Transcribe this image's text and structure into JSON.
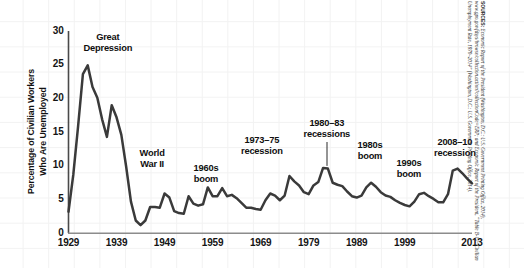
{
  "chart_data": {
    "type": "line",
    "title": "",
    "xlabel": "",
    "ylabel": "Percentage of Civilian Workers Who Are Unemployed",
    "ylabel_line1": "Percentage of Civilian Workers",
    "ylabel_line2": "Who Are Unemployed",
    "xlim": [
      1929,
      2013
    ],
    "ylim": [
      0,
      30
    ],
    "grid": true,
    "grid_style": "faint background graph paper",
    "legend": "none",
    "line_color": "#333333",
    "series_name": "Civilian Unemployment Rate",
    "yticks": [
      "0",
      "5",
      "10",
      "15",
      "20",
      "25",
      "30"
    ],
    "ytick_values": [
      0,
      5,
      10,
      15,
      20,
      25,
      30
    ],
    "xticks": [
      "1929",
      "1939",
      "1949",
      "1959",
      "1969",
      "1979",
      "1989",
      "1999",
      "2013"
    ],
    "xtick_values": [
      1929,
      1939,
      1949,
      1959,
      1969,
      1979,
      1989,
      1999,
      2013
    ],
    "x": [
      1929,
      1930,
      1931,
      1932,
      1933,
      1934,
      1935,
      1936,
      1937,
      1938,
      1939,
      1940,
      1941,
      1942,
      1943,
      1944,
      1945,
      1946,
      1947,
      1948,
      1949,
      1950,
      1951,
      1952,
      1953,
      1954,
      1955,
      1956,
      1957,
      1958,
      1959,
      1960,
      1961,
      1962,
      1963,
      1964,
      1965,
      1966,
      1967,
      1968,
      1969,
      1970,
      1971,
      1972,
      1973,
      1974,
      1975,
      1976,
      1977,
      1978,
      1979,
      1980,
      1981,
      1982,
      1983,
      1984,
      1985,
      1986,
      1987,
      1988,
      1989,
      1990,
      1991,
      1992,
      1993,
      1994,
      1995,
      1996,
      1997,
      1998,
      1999,
      2000,
      2001,
      2002,
      2003,
      2004,
      2005,
      2006,
      2007,
      2008,
      2009,
      2010,
      2011,
      2012,
      2013
    ],
    "values": [
      3.2,
      8.7,
      15.9,
      23.6,
      24.9,
      21.7,
      20.1,
      16.9,
      14.3,
      19.0,
      17.2,
      14.6,
      9.9,
      4.7,
      1.9,
      1.2,
      1.9,
      3.9,
      3.9,
      3.8,
      5.9,
      5.3,
      3.3,
      3.0,
      2.9,
      5.5,
      4.4,
      4.1,
      4.3,
      6.8,
      5.5,
      5.5,
      6.7,
      5.5,
      5.7,
      5.2,
      4.5,
      3.8,
      3.8,
      3.6,
      3.5,
      4.9,
      5.9,
      5.6,
      4.9,
      5.6,
      8.5,
      7.7,
      7.1,
      6.1,
      5.8,
      7.1,
      7.6,
      9.7,
      9.6,
      7.5,
      7.2,
      7.0,
      6.2,
      5.5,
      5.3,
      5.6,
      6.8,
      7.5,
      6.9,
      6.1,
      5.6,
      5.4,
      4.9,
      4.5,
      4.2,
      4.0,
      4.7,
      5.8,
      6.0,
      5.5,
      5.1,
      4.6,
      4.6,
      5.8,
      9.3,
      9.6,
      8.9,
      8.1,
      7.4
    ],
    "annotations": [
      {
        "id": "great-depression",
        "label_line1": "Great",
        "label_line2": "Depression",
        "x": 1933,
        "y": 24.9
      },
      {
        "id": "world-war-ii",
        "label_line1": "World",
        "label_line2": "War II",
        "x": 1944,
        "y": 1.2
      },
      {
        "id": "1960s-boom",
        "label_line1": "1960s",
        "label_line2": "boom",
        "x": 1968,
        "y": 3.6
      },
      {
        "id": "1973-75-recession",
        "label_line1": "1973–75",
        "label_line2": "recession",
        "x": 1975,
        "y": 8.5
      },
      {
        "id": "1980-83-recessions",
        "label_line1": "1980–83",
        "label_line2": "recessions",
        "x": 1982,
        "y": 9.7,
        "leader_line": true
      },
      {
        "id": "1980s-boom",
        "label_line1": "1980s",
        "label_line2": "boom",
        "x": 1989,
        "y": 5.3
      },
      {
        "id": "1990s-boom",
        "label_line1": "1990s",
        "label_line2": "boom",
        "x": 2000,
        "y": 4.0
      },
      {
        "id": "2008-10-recession",
        "label_line1": "2008–10",
        "label_line2": "recession",
        "x": 2010,
        "y": 9.6
      }
    ]
  },
  "source_note": {
    "prefix": "SOURCES:",
    "text": "Economic Report of the President (Washington, D.C.: U.S. Government Printing Office, 2014), www.gpo.gov/fdsys/browse/collection.action?collectionCode=ERP; and Economic Report of the President, “Table B-12: Civilian Unemployment Rate, 1970–2014” (Washington, D.C.: U.S. Government Printing Office, 2014)."
  }
}
